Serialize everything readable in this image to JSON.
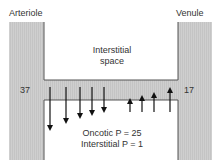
{
  "labels": {
    "arteriole": "Arteriole",
    "venule": "Venule",
    "interstitial_line1": "Interstitial",
    "interstitial_line2": "space",
    "arteriole_pressure": "37",
    "venule_pressure": "17",
    "oncotic": "Oncotic P = 25",
    "interstitial_p": "Interstitial P = 1"
  },
  "colors": {
    "vessel_fill": "#cfcfcf",
    "vessel_stroke": "#555555",
    "arrow": "#111111",
    "text": "#333333"
  },
  "arrows": {
    "filtration": [
      {
        "x": 50,
        "y1": 87,
        "y2": 131
      },
      {
        "x": 66,
        "y1": 87,
        "y2": 124
      },
      {
        "x": 80,
        "y1": 87,
        "y2": 119
      },
      {
        "x": 92,
        "y1": 87,
        "y2": 116
      },
      {
        "x": 104,
        "y1": 87,
        "y2": 113
      }
    ],
    "reabsorption": [
      {
        "x": 130,
        "y1": 112,
        "y2": 98
      },
      {
        "x": 142,
        "y1": 112,
        "y2": 95
      },
      {
        "x": 154,
        "y1": 112,
        "y2": 92
      },
      {
        "x": 170,
        "y1": 112,
        "y2": 87
      }
    ]
  }
}
